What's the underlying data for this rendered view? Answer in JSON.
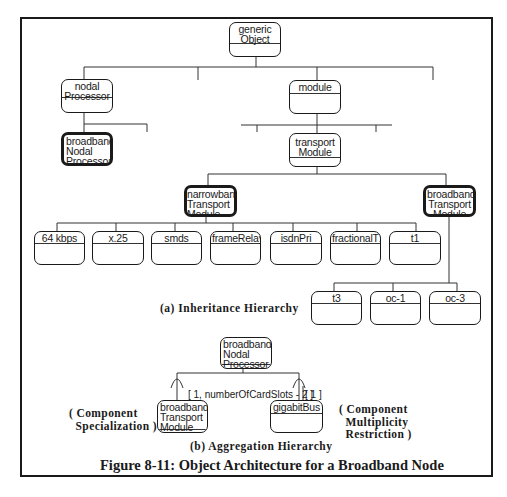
{
  "figure": {
    "title": "Figure 8-11: Object Architecture for a Broadband Node",
    "caption_a": "(a) Inheritance Hierarchy",
    "caption_b": "(b) Aggregation Hierarchy"
  },
  "inheritance": {
    "root": {
      "name": "generic\nObject"
    },
    "level1": [
      {
        "name": "nodal\nProcessor"
      },
      {
        "name": "module"
      }
    ],
    "nodal_children": [
      {
        "name": "broadband\nNodal\nProcessor",
        "emphasized": true
      }
    ],
    "module_children": [
      {
        "name": "transport\nModule"
      }
    ],
    "transport_children": [
      {
        "name": "narrowband\nTransport\nModule",
        "emphasized": true
      },
      {
        "name": "broadband\nTransport\nModule",
        "emphasized": true
      }
    ],
    "narrowband_children": [
      {
        "name": "64 kbps"
      },
      {
        "name": "x.25"
      },
      {
        "name": "smds"
      },
      {
        "name": "frameRelay"
      },
      {
        "name": "isdnPri"
      },
      {
        "name": "fractionalT1"
      },
      {
        "name": "t1"
      }
    ],
    "broadband_children": [
      {
        "name": "t3"
      },
      {
        "name": "oc-1"
      },
      {
        "name": "oc-3"
      }
    ]
  },
  "aggregation": {
    "whole": {
      "name": "broadband\nNodal\nProcessor"
    },
    "parts": [
      {
        "name": "broadband\nTransport\nModule",
        "multiplicity": "[ 1, numberOfCardSlots - 2 ]"
      },
      {
        "name": "gigabitBus",
        "multiplicity": "[ 1 ]"
      }
    ],
    "notes": {
      "left": "( Component\n  Specialization )",
      "right": "( Component\n  Multiplicity\n  Restriction )"
    }
  }
}
